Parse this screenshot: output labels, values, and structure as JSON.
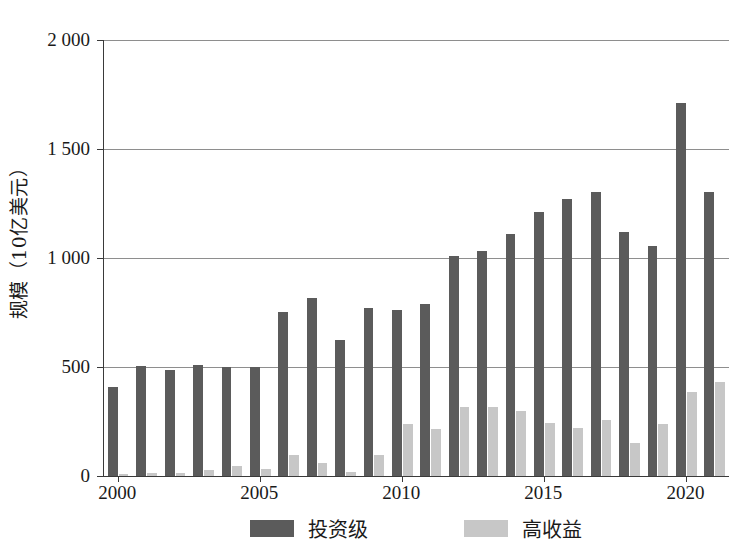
{
  "chart_data": {
    "type": "bar",
    "title": "",
    "subtitle": "",
    "xlabel": "",
    "ylabel": "规模（10亿美元）",
    "ylim": [
      0,
      2000
    ],
    "ytick_values": [
      0,
      500,
      1000,
      1500,
      2000
    ],
    "ytick_labels": [
      "0",
      "500",
      "1 000",
      "1 500",
      "2 000"
    ],
    "grid": true,
    "legend_position": "bottom",
    "categories": [
      "2000",
      "2001",
      "2002",
      "2003",
      "2004",
      "2005",
      "2006",
      "2007",
      "2008",
      "2009",
      "2010",
      "2011",
      "2012",
      "2013",
      "2014",
      "2015",
      "2016",
      "2017",
      "2018",
      "2019",
      "2020",
      "2021"
    ],
    "xtick_labels": [
      "2000",
      "2005",
      "2010",
      "2015",
      "2020"
    ],
    "xtick_categories": [
      "2000",
      "2005",
      "2010",
      "2015",
      "2020"
    ],
    "series": [
      {
        "name": "投资级",
        "color": "#5b5b5b",
        "values": [
          410,
          505,
          487,
          510,
          500,
          500,
          752,
          815,
          622,
          772,
          763,
          788,
          1010,
          1030,
          1112,
          1212,
          1272,
          1303,
          1118,
          1055,
          1710,
          1305
        ]
      },
      {
        "name": "高收益",
        "color": "#c7c7c7",
        "values": [
          8,
          12,
          14,
          28,
          44,
          30,
          98,
          58,
          20,
          96,
          240,
          215,
          318,
          315,
          300,
          245,
          222,
          255,
          150,
          240,
          385,
          430
        ]
      }
    ]
  },
  "legend": {
    "entries": [
      {
        "label": "投资级",
        "color": "#5b5b5b"
      },
      {
        "label": "高收益",
        "color": "#c7c7c7"
      }
    ]
  },
  "axis": {
    "y_title": "规模（10亿美元）"
  },
  "colors": {
    "investment_grade": "#5b5b5b",
    "high_yield": "#c7c7c7",
    "axis": "#3a3a3a",
    "gridline": "#8e8e8e",
    "background": "#ffffff"
  }
}
